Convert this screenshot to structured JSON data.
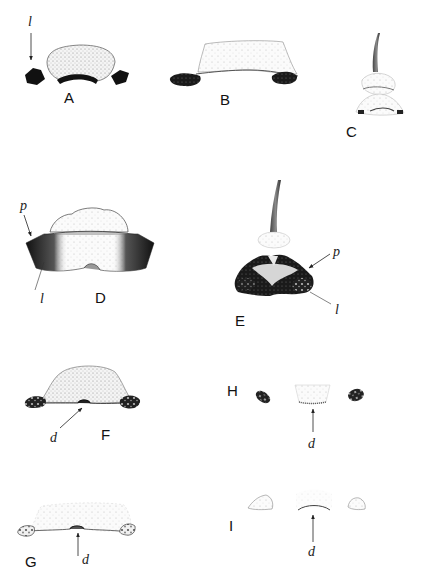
{
  "figure": {
    "panels": [
      {
        "id": "A",
        "label": "A",
        "annotations": [
          "l"
        ]
      },
      {
        "id": "B",
        "label": "B",
        "annotations": []
      },
      {
        "id": "C",
        "label": "C",
        "annotations": []
      },
      {
        "id": "D",
        "label": "D",
        "annotations": [
          "p",
          "l"
        ]
      },
      {
        "id": "E",
        "label": "E",
        "annotations": [
          "p",
          "l"
        ]
      },
      {
        "id": "F",
        "label": "F",
        "annotations": [
          "d"
        ]
      },
      {
        "id": "G",
        "label": "G",
        "annotations": [
          "d"
        ]
      },
      {
        "id": "H",
        "label": "H",
        "annotations": [
          "d"
        ]
      },
      {
        "id": "I",
        "label": "I",
        "annotations": [
          "d"
        ]
      }
    ],
    "annotation_letters": {
      "l": "l",
      "p": "p",
      "d": "d"
    },
    "colors": {
      "ink": "#111111",
      "stipple": "#d9d9d9",
      "paper": "#ffffff"
    }
  }
}
